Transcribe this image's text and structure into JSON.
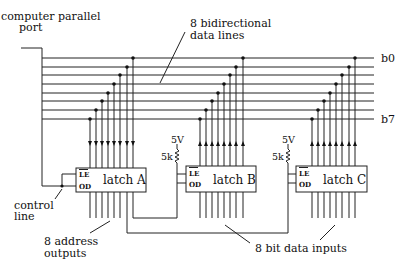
{
  "title_labels": {
    "port": [
      "computer parallel",
      "port"
    ],
    "bus": [
      "8 bidirectional",
      "data lines"
    ],
    "bit_first": "b0",
    "bit_last": "b7",
    "control": [
      "control",
      "line"
    ],
    "address": [
      "8 address",
      "outputs"
    ],
    "data_inputs": "8 bit data inputs"
  },
  "latches": [
    {
      "name": "latch A",
      "le": "LE",
      "od": "OD",
      "direction": "bus-to-latch"
    },
    {
      "name": "latch B",
      "le": "LE",
      "od": "OD",
      "direction": "latch-to-bus",
      "supply": "5V",
      "resistor": "5k"
    },
    {
      "name": "latch C",
      "le": "LE",
      "od": "OD",
      "direction": "latch-to-bus",
      "supply": "5V",
      "resistor": "5k"
    }
  ],
  "bus": {
    "line_count": 8
  }
}
